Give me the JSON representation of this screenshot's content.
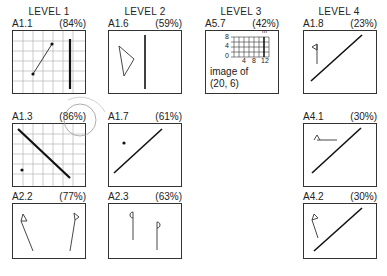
{
  "levels": [
    {
      "label": "LEVEL 1"
    },
    {
      "label": "LEVEL 2"
    },
    {
      "label": "LEVEL 3"
    },
    {
      "label": "LEVEL 4"
    }
  ],
  "cards": {
    "a1_1": {
      "id": "A1.1",
      "score": "(84%)",
      "content": "grid with line segment between two points and vertical thick line"
    },
    "a1_3": {
      "id": "A1.3",
      "score": "(86%)",
      "content": "grid with diagonal thick line and single point",
      "annotation": "circled score"
    },
    "a2_2": {
      "id": "A2.2",
      "score": "(77%)",
      "content": "two flags on slanted poles"
    },
    "a1_6": {
      "id": "A1.6",
      "score": "(59%)",
      "content": "triangle and vertical line"
    },
    "a1_7": {
      "id": "A1.7",
      "score": "(61%)",
      "content": "point and diagonal line"
    },
    "a2_3": {
      "id": "A2.3",
      "score": "(63%)",
      "content": "two vertical stems with letters q and p"
    },
    "a5_7": {
      "id": "A5.7",
      "score": "(42%)",
      "content": "small grid with line m",
      "grid": {
        "y_ticks": [
          "8",
          "4",
          "0"
        ],
        "x_ticks": [
          "4",
          "8",
          "12"
        ],
        "line_label": "m"
      },
      "caption_line1": "image of",
      "caption_line2": "(20, 6)"
    },
    "a1_8": {
      "id": "A1.8",
      "score": "(23%)",
      "content": "flag and diagonal line"
    },
    "a4_1": {
      "id": "A4.1",
      "score": "(30%)",
      "content": "horizontal flag and diagonal line"
    },
    "a4_2": {
      "id": "A4.2",
      "score": "(30%)",
      "content": "slanted flag and diagonal line"
    }
  }
}
